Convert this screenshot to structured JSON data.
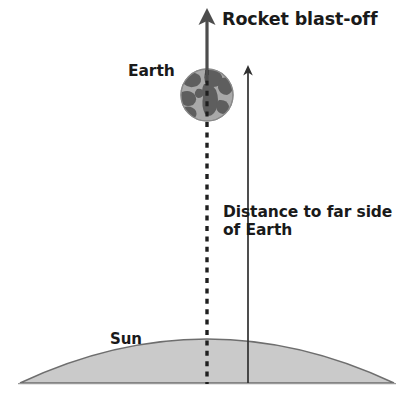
{
  "figure": {
    "type": "scientific-diagram",
    "background_color": "#ffffff",
    "title_text": "Rocket blast-off"
  },
  "labels": {
    "rocket_blast_off": "Rocket blast-off",
    "earth": "Earth",
    "distance_to_far_side": "Distance to far side of Earth",
    "sun": "Sun",
    "caption": ""
  },
  "colors": {
    "text": "#1a1a1a",
    "sun_fill": "#cacaca",
    "sun_outline": "#6e6e6e",
    "earth_ocean": "#a8a8a8",
    "earth_land": "#5e5e5e",
    "earth_outline": "#8c8c8c",
    "rocket_arrow": "#4a4a4a",
    "distance_arrow": "#3a3a3a",
    "dotted_line": "#1f1f1f"
  },
  "elements": {
    "rocket_arrow": {
      "name": "Rocket blast-off arrow",
      "direction": "up",
      "x": 207,
      "y_tip": 10,
      "y_tail": 78,
      "stroke_width": 3.2
    },
    "dotted_axis": {
      "name": "Earth centre dotted axis",
      "x": 207,
      "y_top": 72,
      "y_bottom": 383,
      "dash": "5 5",
      "stroke_width": 3.4
    },
    "distance_arrow": {
      "name": "Distance to far side of Earth measure arrow",
      "direction": "up",
      "x": 248,
      "y_tip": 66,
      "y_bottom": 383,
      "stroke_width": 1.6
    },
    "earth": {
      "name": "Earth globe",
      "center_x": 207,
      "center_y": 95,
      "radius": 26
    },
    "sun": {
      "name": "Sun limb dome",
      "left_x": 20,
      "right_x": 394,
      "baseline_y": 383,
      "apex_y": 313
    }
  }
}
